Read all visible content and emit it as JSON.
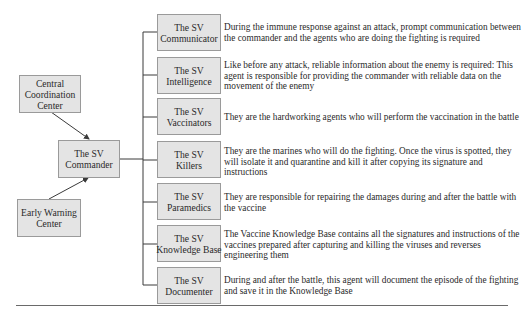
{
  "left_nodes": {
    "central": {
      "line1": "Central",
      "line2": "Coordination",
      "line3": "Center"
    },
    "commander": {
      "line1": "The SV",
      "line2": "Commander"
    },
    "early_warning": {
      "line1": "Early Warning",
      "line2": "Center"
    }
  },
  "agents": [
    {
      "line1": "The SV",
      "line2": "Communicator",
      "description": "During the immune response against an attack, prompt communication between the commander and the agents who are doing the fighting is required"
    },
    {
      "line1": "The SV",
      "line2": "Intelligence",
      "description": "Like before any attack, reliable information about the enemy is required: This agent is responsible for providing the commander with reliable data on the movement of the enemy"
    },
    {
      "line1": "The SV",
      "line2": "Vaccinators",
      "description": "They are the hardworking agents who will perform the vaccination in the battle"
    },
    {
      "line1": "The SV",
      "line2": "Killers",
      "description": "They are the marines who will do the fighting. Once the virus is spotted, they will isolate it and quarantine and kill it after copying its signature and instructions"
    },
    {
      "line1": "The SV",
      "line2": "Paramedics",
      "description": "They are responsible for repairing the damages during and after the battle with the vaccine"
    },
    {
      "line1": "The SV",
      "line2": "Knowledge Base",
      "description": "The Vaccine Knowledge Base contains all the signatures and instructions of the vaccines prepared after capturing and killing the viruses and reverses engineering them"
    },
    {
      "line1": "The SV",
      "line2": "Documenter",
      "description": "During and after the battle, this agent will document the episode of the fighting and save it in the Knowledge Base"
    }
  ],
  "colors": {
    "box_fill": "#e4e4e4",
    "box_border": "#9a9a9a",
    "line": "#3a3a3a"
  }
}
